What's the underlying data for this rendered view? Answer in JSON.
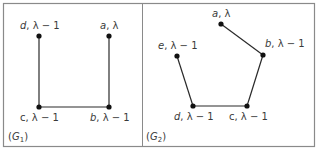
{
  "colors": {
    "frame": "#8a8a8a",
    "edge": "#2a2a2a",
    "node": "#111111",
    "text": "#3a3a3a",
    "background": "#ffffff"
  },
  "panels": [
    {
      "id": "G1",
      "caption_open": "(",
      "caption_var": "G",
      "caption_sub": "1",
      "caption_close": ")",
      "nodes": [
        {
          "id": "d",
          "var": "d",
          "weight": ", λ − 1",
          "x": 39,
          "y": 36
        },
        {
          "id": "a",
          "var": "a",
          "weight": ", λ",
          "x": 109,
          "y": 36
        },
        {
          "id": "c",
          "var": "c",
          "weight": ", λ − 1",
          "x": 39,
          "y": 107
        },
        {
          "id": "b",
          "var": "b",
          "weight": ", λ − 1",
          "x": 109,
          "y": 107
        }
      ],
      "edges": [
        [
          "d",
          "c"
        ],
        [
          "c",
          "b"
        ],
        [
          "b",
          "a"
        ]
      ]
    },
    {
      "id": "G2",
      "caption_open": "(",
      "caption_var": "G",
      "caption_sub": "2",
      "caption_close": ")",
      "nodes": [
        {
          "id": "a",
          "var": "a",
          "weight": ", λ",
          "x": 221,
          "y": 24
        },
        {
          "id": "b",
          "var": "b",
          "weight": ", λ − 1",
          "x": 263,
          "y": 55
        },
        {
          "id": "e",
          "var": "e",
          "weight": ", λ − 1",
          "x": 177,
          "y": 56
        },
        {
          "id": "d",
          "var": "d",
          "weight": ", λ − 1",
          "x": 193,
          "y": 106
        },
        {
          "id": "c",
          "var": "c",
          "weight": ", λ − 1",
          "x": 247,
          "y": 106
        }
      ],
      "edges": [
        [
          "a",
          "b"
        ],
        [
          "b",
          "c"
        ],
        [
          "c",
          "d"
        ],
        [
          "d",
          "e"
        ]
      ]
    }
  ],
  "labels": {
    "g1_d": {
      "var": "d",
      "weight": ", λ − 1"
    },
    "g1_a": {
      "var": "a",
      "weight": ", λ"
    },
    "g1_c": {
      "var": "c",
      "weight": ", λ − 1"
    },
    "g1_b": {
      "var": "b",
      "weight": ", λ − 1"
    },
    "g2_a": {
      "var": "a",
      "weight": ", λ"
    },
    "g2_b": {
      "var": "b",
      "weight": ", λ − 1"
    },
    "g2_e": {
      "var": "e",
      "weight": ", λ − 1"
    },
    "g2_d": {
      "var": "d",
      "weight": ", λ − 1"
    },
    "g2_c": {
      "var": "c",
      "weight": ", λ − 1"
    }
  },
  "captions": {
    "g1": {
      "open": "(",
      "var": "G",
      "sub": "1",
      "close": ")"
    },
    "g2": {
      "open": "(",
      "var": "G",
      "sub": "2",
      "close": ")"
    }
  }
}
